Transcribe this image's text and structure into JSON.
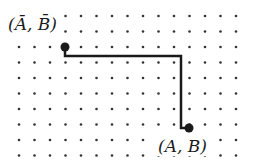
{
  "diagram": {
    "type": "lattice-path",
    "grid": {
      "origin_x": 19,
      "origin_y": 16,
      "spacing": 15.5,
      "columns": 15,
      "rows": 10,
      "dot_color": "#333333",
      "dot_radius": 1.3
    },
    "path": {
      "color": "#1a1a1a",
      "width": 2.5,
      "points": [
        [
          65,
          47
        ],
        [
          65,
          56
        ],
        [
          181,
          56
        ],
        [
          181,
          128
        ],
        [
          189,
          128
        ]
      ]
    },
    "start_point": {
      "x": 65,
      "y": 47,
      "label": "(Ā, B̄)",
      "label_x": 8,
      "label_y": 30
    },
    "end_point": {
      "x": 189,
      "y": 128,
      "label": "(A, B)",
      "label_x": 158,
      "label_y": 152
    }
  }
}
